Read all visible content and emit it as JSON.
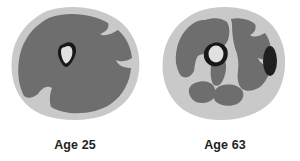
{
  "figure": {
    "background_color": "#ffffff"
  },
  "colors": {
    "background": "#ffffff",
    "subcutaneous_fat": "#c9c9c9",
    "fat_light": "#d2d2d2",
    "muscle": "#6e6e6e",
    "muscle_dark": "#656565",
    "cortical_bone": "#181818",
    "bone_marrow": "#e0e0e0",
    "intramuscular_fat_dark": "#1f1f1f",
    "caption_text": "#231f20"
  },
  "panels": [
    {
      "id": "age-25",
      "caption": "Age 25",
      "scan_label": "thigh cross-section age 25",
      "tissues": [
        {
          "name": "subcutaneous-fat",
          "color": "#c9c9c9"
        },
        {
          "name": "muscle",
          "color": "#6e6e6e"
        },
        {
          "name": "cortical-bone",
          "color": "#181818"
        },
        {
          "name": "bone-marrow",
          "color": "#e0e0e0"
        }
      ]
    },
    {
      "id": "age-63",
      "caption": "Age 63",
      "scan_label": "thigh cross-section age 63",
      "tissues": [
        {
          "name": "subcutaneous-fat",
          "color": "#c9c9c9"
        },
        {
          "name": "muscle",
          "color": "#6e6e6e"
        },
        {
          "name": "intramuscular-fat",
          "color": "#c9c9c9"
        },
        {
          "name": "cortical-bone",
          "color": "#181818"
        },
        {
          "name": "bone-marrow",
          "color": "#e0e0e0"
        },
        {
          "name": "fat-deposit",
          "color": "#1f1f1f"
        }
      ]
    }
  ]
}
